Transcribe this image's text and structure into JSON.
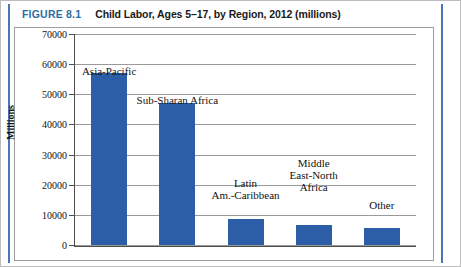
{
  "figure": {
    "number_label": "FIGURE 8.1",
    "title": "Child Labor, Ages 5–17, by Region, 2012 (millions)",
    "accent_color": "#2e6da4",
    "bar_color": "#2b5ea6"
  },
  "chart_data": {
    "type": "bar",
    "title": "Child Labor, Ages 5–17, by Region, 2012 (millions)",
    "categories": [
      "Asia-Pacific",
      "Sub-Sharan Africa",
      "Latin Am.-Caribbean",
      "Middle East-North Africa",
      "Other"
    ],
    "values": [
      57000,
      47000,
      8500,
      6500,
      5500
    ],
    "xlabel": "",
    "ylabel": "Millions",
    "ylim": [
      0,
      70000
    ],
    "ytick_labels": [
      "70000",
      "60000",
      "50000",
      "40000",
      "30000",
      "20000",
      "10000",
      "0"
    ],
    "ytick_values": [
      70000,
      60000,
      50000,
      40000,
      30000,
      20000,
      10000,
      0
    ],
    "grid": true,
    "legend": "none",
    "series_color": "#2b5ea6",
    "annotations": [
      {
        "text": "Asia-Pacific",
        "category": "Asia-Pacific"
      },
      {
        "text": "Sub-Sharan Africa",
        "category": "Sub-Sharan Africa"
      },
      {
        "text": "Latin\nAm.-Caribbean",
        "category": "Latin Am.-Caribbean"
      },
      {
        "text": "Middle\nEast-North\nAfrica",
        "category": "Middle East-North Africa"
      },
      {
        "text": "Other",
        "category": "Other"
      }
    ]
  }
}
